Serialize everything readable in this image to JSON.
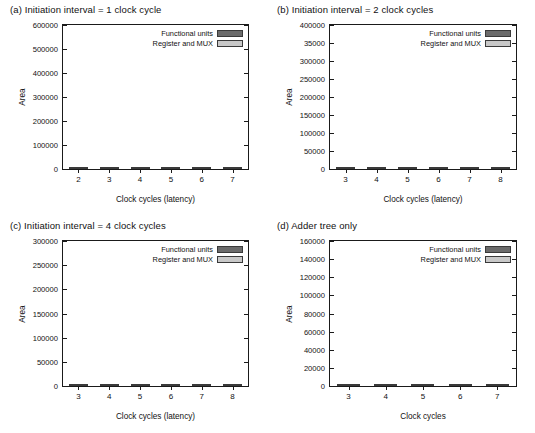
{
  "chart_data": [
    {
      "type": "bar",
      "panel": "a",
      "title": "(a) Initiation interval = 1 clock cycle",
      "xlabel": "Clock cycles (latency)",
      "ylabel": "Area",
      "categories": [
        "2",
        "3",
        "4",
        "5",
        "6",
        "7"
      ],
      "yticks": [
        "0",
        "100000",
        "200000",
        "300000",
        "400000",
        "500000",
        "600000"
      ],
      "ytick_values": [
        0,
        100000,
        200000,
        300000,
        400000,
        500000,
        600000
      ],
      "ylim": [
        0,
        600000
      ],
      "grid": false,
      "legend_position": "top-right",
      "series": [
        {
          "name": "Functional units",
          "values": [
            462000,
            440000,
            405000,
            396000,
            391000,
            391000
          ]
        },
        {
          "name": "Register and MUX",
          "values": [
            57000,
            76000,
            92000,
            97000,
            102000,
            102000
          ]
        }
      ],
      "totals": [
        519000,
        516000,
        497000,
        493000,
        493000,
        493000
      ]
    },
    {
      "type": "bar",
      "panel": "b",
      "title": "(b) Initiation interval = 2 clock cycles",
      "xlabel": "Clock cycles (latency)",
      "ylabel": "Area",
      "categories": [
        "3",
        "4",
        "5",
        "6",
        "7",
        "8"
      ],
      "yticks": [
        "0",
        "50000",
        "100000",
        "150000",
        "200000",
        "250000",
        "300000",
        "35000",
        "400000"
      ],
      "ytick_values": [
        0,
        50000,
        100000,
        150000,
        200000,
        250000,
        300000,
        350000,
        400000
      ],
      "ylim": [
        0,
        400000
      ],
      "grid": false,
      "legend_position": "top-right",
      "series": [
        {
          "name": "Functional units",
          "values": [
            258000,
            224000,
            209000,
            197000,
            195000,
            194000
          ]
        },
        {
          "name": "Register and MUX",
          "values": [
            146000,
            159000,
            165000,
            169000,
            167000,
            168000
          ]
        }
      ],
      "totals": [
        404000,
        383000,
        374000,
        366000,
        362000,
        362000
      ]
    },
    {
      "type": "bar",
      "panel": "c",
      "title": "(c) Initiation interval = 4 clock cycles",
      "xlabel": "Clock cycles (latency)",
      "ylabel": "Area",
      "categories": [
        "3",
        "4",
        "5",
        "6",
        "7",
        "8"
      ],
      "yticks": [
        "0",
        "50000",
        "100000",
        "150000",
        "200000",
        "250000",
        "300000"
      ],
      "ytick_values": [
        0,
        50000,
        100000,
        150000,
        200000,
        250000,
        300000
      ],
      "ylim": [
        0,
        300000
      ],
      "grid": false,
      "legend_position": "top-right",
      "series": [
        {
          "name": "Functional units",
          "values": [
            144000,
            136000,
            116000,
            110000,
            107000,
            108000
          ]
        },
        {
          "name": "Register and MUX",
          "values": [
            149000,
            149000,
            152000,
            152000,
            156000,
            155000
          ]
        }
      ],
      "totals": [
        293000,
        285000,
        268000,
        262000,
        263000,
        263000
      ]
    },
    {
      "type": "bar",
      "panel": "d",
      "title": "(d) Adder tree only",
      "xlabel": "Clock cycles",
      "ylabel": "Area",
      "categories": [
        "3",
        "4",
        "5",
        "6",
        "7"
      ],
      "yticks": [
        "0",
        "20000",
        "40000",
        "60000",
        "80000",
        "100000",
        "120000",
        "140000",
        "160000"
      ],
      "ytick_values": [
        0,
        20000,
        40000,
        60000,
        80000,
        100000,
        120000,
        140000,
        160000
      ],
      "ylim": [
        0,
        160000
      ],
      "grid": false,
      "legend_position": "top-right",
      "series": [
        {
          "name": "Functional units",
          "values": [
            119000,
            86000,
            81000,
            74000,
            66000
          ]
        },
        {
          "name": "Register and MUX",
          "values": [
            35000,
            39000,
            42000,
            48000,
            60000
          ]
        }
      ],
      "totals": [
        154000,
        125000,
        123000,
        122000,
        126000
      ]
    }
  ],
  "legend": {
    "functional_units": "Functional units",
    "register_and_mux": "Register and MUX"
  },
  "colors": {
    "functional_units": "#6b6b6b",
    "register_and_mux": "#b0b0b0",
    "axis": "#1a1a1a",
    "background": "#ffffff"
  }
}
